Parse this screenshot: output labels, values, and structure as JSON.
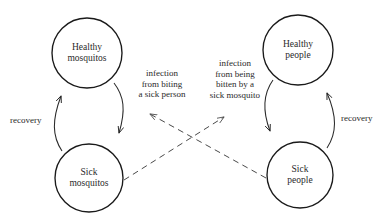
{
  "diagram": {
    "stroke_color": "#1a1a1a",
    "dashed_color": "#4a4a4a",
    "background": "#ffffff",
    "compartments": [
      {
        "id": "healthy-mosquitos",
        "line1": "Healthy",
        "line2": "mosquitos",
        "cx": 87,
        "cy": 53,
        "r": 35
      },
      {
        "id": "healthy-people",
        "line1": "Healthy",
        "line2": "people",
        "cx": 298,
        "cy": 50,
        "r": 35
      },
      {
        "id": "sick-mosquitos",
        "line1": "Sick",
        "line2": "mosquitos",
        "cx": 89,
        "cy": 178,
        "r": 34
      },
      {
        "id": "sick-people",
        "line1": "Sick",
        "line2": "people",
        "cx": 300,
        "cy": 175,
        "r": 33
      }
    ],
    "edge_labels": [
      {
        "id": "mosquito-infection",
        "lines": [
          "infection",
          "from biting",
          "a sick person"
        ]
      },
      {
        "id": "human-infection",
        "lines": [
          "infection",
          "from being",
          "bitten by a",
          "sick mosquito"
        ]
      },
      {
        "id": "mosquito-recovery",
        "lines": [
          "recovery"
        ]
      },
      {
        "id": "human-recovery",
        "lines": [
          "recovery"
        ]
      }
    ]
  }
}
